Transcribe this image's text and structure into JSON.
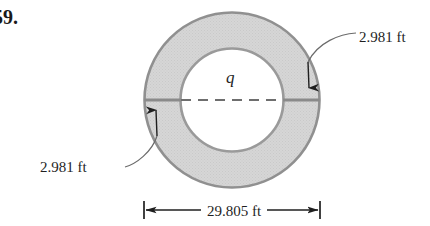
{
  "problem": {
    "number": "59."
  },
  "figure": {
    "center_label": "q",
    "thickness_label_top": "2.981 ft",
    "thickness_label_bottom": "2.981 ft",
    "diameter_label": "29.805 ft",
    "colors": {
      "annulus_fill": "#d4d4d4",
      "outline": "#8c8c8c",
      "line": "#6e6e6e",
      "text": "#1f1f1f"
    },
    "geometry": {
      "center_x": 232,
      "center_y": 100,
      "outer_radius": 88,
      "inner_radius": 52
    }
  }
}
